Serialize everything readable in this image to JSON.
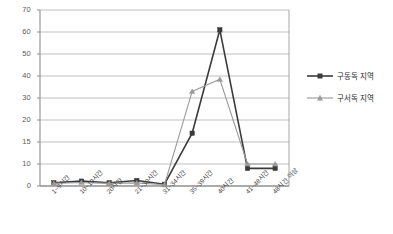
{
  "chart_data": {
    "type": "line",
    "title": "",
    "xlabel": "",
    "ylabel": "",
    "grid": true,
    "legend_position": "right",
    "categories": [
      "1~9시간",
      "10~19시간",
      "20시간",
      "21~30시간",
      "31~34시간",
      "35~39시간",
      "40시간",
      "41~48시간",
      "48시간 이상"
    ],
    "yticks": [
      70,
      60,
      50,
      40,
      30,
      20,
      15,
      10,
      0
    ],
    "ylim": [
      0,
      70
    ],
    "yaxis_spacing": "irregular",
    "series": [
      {
        "name": "구동독 지역",
        "color": "#3b3b3b",
        "marker": "square",
        "values": [
          1.5,
          2.2,
          1.5,
          2.5,
          0.8,
          17,
          61,
          8,
          8
        ]
      },
      {
        "name": "구서독 지역",
        "color": "#9a9a9a",
        "marker": "triangle",
        "values": [
          1.2,
          1.6,
          1.2,
          1.4,
          0.6,
          33,
          38.5,
          10,
          10
        ]
      }
    ]
  },
  "legend": {
    "items": [
      {
        "label": "구동독 지역"
      },
      {
        "label": "구서독 지역"
      }
    ]
  },
  "colors": {
    "series_east": "#3b3b3b",
    "series_west": "#9a9a9a",
    "grid": "#b8b8b8",
    "axis": "#8f8f8f",
    "plot_border": "#9c9c9c",
    "background": "#ffffff",
    "tick_text": "#5a5a5a"
  }
}
